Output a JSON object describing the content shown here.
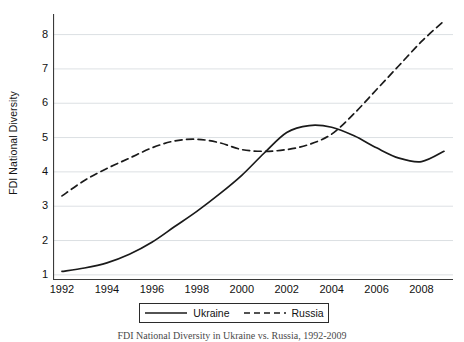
{
  "chart_data": {
    "type": "line",
    "title": "",
    "subtitle": "",
    "xlabel": "",
    "ylabel": "FDI National Diversity",
    "xlim": [
      1991.6,
      2009.4
    ],
    "ylim": [
      0.85,
      8.6
    ],
    "grid": "horizontal",
    "legend_position": "below-center",
    "x": [
      1992,
      1993,
      1994,
      1995,
      1996,
      1997,
      1998,
      1999,
      2000,
      2001,
      2002,
      2003,
      2004,
      2005,
      2006,
      2007,
      2008,
      2009
    ],
    "xticks": [
      1992,
      1994,
      1996,
      1998,
      2000,
      2002,
      2004,
      2006,
      2008
    ],
    "xtick_labels": [
      "1992",
      "1994",
      "1996",
      "1998",
      "2000",
      "2002",
      "2004",
      "2006",
      "2008"
    ],
    "yticks": [
      1,
      2,
      3,
      4,
      5,
      6,
      7,
      8
    ],
    "ytick_labels": [
      "1",
      "2",
      "3",
      "4",
      "5",
      "6",
      "7",
      "8"
    ],
    "series": [
      {
        "name": "Ukraine",
        "style": "solid",
        "color": "#1a1a1a",
        "values": [
          1.1,
          1.2,
          1.35,
          1.6,
          1.95,
          2.4,
          2.85,
          3.35,
          3.9,
          4.55,
          5.15,
          5.35,
          5.3,
          5.05,
          4.7,
          4.4,
          4.3,
          4.6
        ]
      },
      {
        "name": "Russia",
        "style": "dashed",
        "color": "#1a1a1a",
        "values": [
          3.3,
          3.75,
          4.1,
          4.4,
          4.7,
          4.9,
          4.95,
          4.85,
          4.65,
          4.6,
          4.65,
          4.8,
          5.1,
          5.7,
          6.4,
          7.1,
          7.8,
          8.4
        ]
      }
    ]
  },
  "axes": {
    "ylabel": "FDI National Diversity"
  },
  "legend": {
    "entries": [
      {
        "label": "Ukraine",
        "style": "solid"
      },
      {
        "label": "Russia",
        "style": "dashed"
      }
    ]
  },
  "caption": {
    "text": "FDI National Diversity in Ukraine vs. Russia, 1992-2009"
  }
}
